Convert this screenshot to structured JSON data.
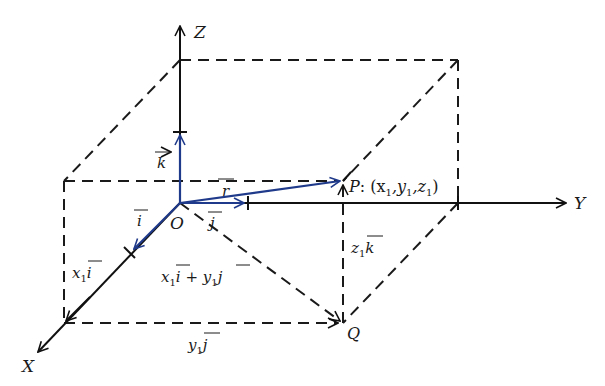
{
  "diagram": {
    "colors": {
      "axis": "#111111",
      "dashed": "#1a1a1a",
      "vector": "#1f3a8a"
    },
    "axes": {
      "x_label": "X",
      "y_label": "Y",
      "z_label": "Z",
      "origin_label": "O"
    },
    "points": {
      "P": {
        "name": "P",
        "coords_label": ": (x",
        "x_sub": "1",
        "y": ",y",
        "y_sub": "1",
        "z": ",z",
        "z_sub": "1",
        "close": ")"
      },
      "Q": {
        "name": "Q"
      }
    },
    "unit_vectors": {
      "i": "i",
      "j": "j",
      "k": "k",
      "r": "r"
    },
    "component_labels": {
      "x1i": {
        "coef": "x",
        "sub": "1",
        "vec": "i"
      },
      "y1j": {
        "coef": "y",
        "sub": "1",
        "vec": "j"
      },
      "z1k": {
        "coef": "z",
        "sub": "1",
        "vec": "k"
      },
      "sum": {
        "a_coef": "x",
        "a_sub": "1",
        "a_vec": "i",
        "plus": " + ",
        "b_coef": "y",
        "b_sub": "1",
        "b_vec": "j"
      }
    }
  }
}
